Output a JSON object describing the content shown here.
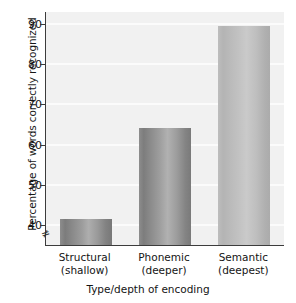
{
  "chart_data": {
    "type": "bar",
    "title": "",
    "xlabel": "Type/depth of encoding",
    "ylabel": "Percentage of words correctly recognized",
    "categories": [
      "Structural (shallow)",
      "Phonemic (deeper)",
      "Semantic (deepest)"
    ],
    "category_lines": [
      {
        "line1": "Structural",
        "line2": "(shallow)"
      },
      {
        "line1": "Phonemic",
        "line2": "(deeper)"
      },
      {
        "line1": "Semantic",
        "line2": "(deepest)"
      }
    ],
    "values": [
      41.5,
      64.2,
      89.5
    ],
    "ylim": [
      35,
      93
    ],
    "yticks": [
      40,
      50,
      60,
      70,
      80,
      90
    ],
    "ytick_labels": [
      "40",
      "50",
      "60",
      "70",
      "80",
      "90"
    ],
    "grid": true,
    "legend": "none",
    "axis_break": "≠",
    "bar_colors": [
      "#9a9a9a",
      "#9c9c9c",
      "#bdbdbd"
    ],
    "plot_background": "#f1f1f1",
    "axis_color": "#3c3c3c",
    "gridline_color": "#fbfbfb"
  }
}
